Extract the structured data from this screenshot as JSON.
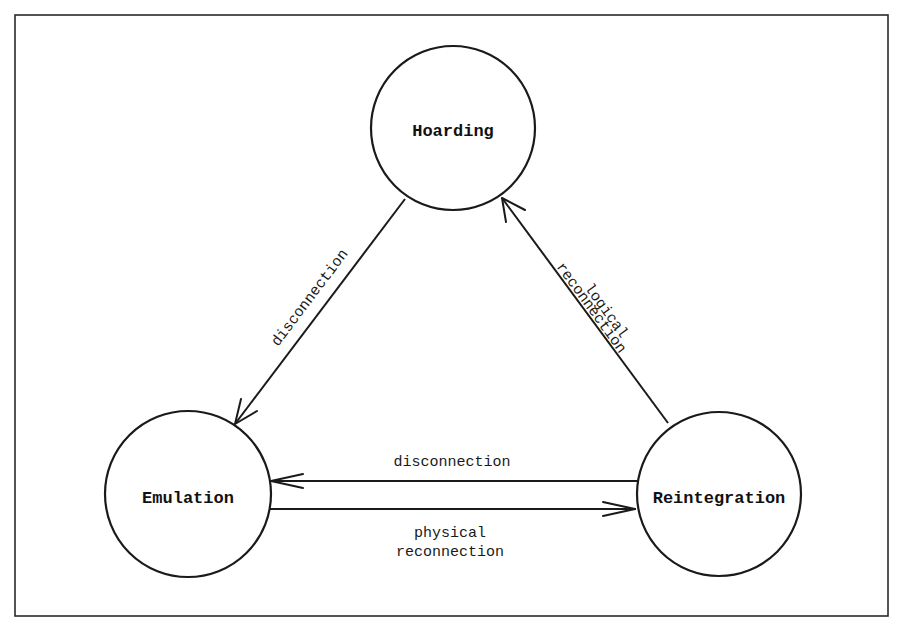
{
  "diagram": {
    "type": "state-transition",
    "states": [
      {
        "id": "hoarding",
        "label": "Hoarding"
      },
      {
        "id": "emulation",
        "label": "Emulation"
      },
      {
        "id": "reintegration",
        "label": "Reintegration"
      }
    ],
    "transitions": [
      {
        "from": "hoarding",
        "to": "emulation",
        "label_lines": [
          "disconnection"
        ]
      },
      {
        "from": "reintegration",
        "to": "hoarding",
        "label_lines": [
          "logical",
          "reconnection"
        ]
      },
      {
        "from": "reintegration",
        "to": "emulation",
        "label_lines": [
          "disconnection"
        ]
      },
      {
        "from": "emulation",
        "to": "reintegration",
        "label_lines": [
          "physical",
          "reconnection"
        ]
      }
    ]
  },
  "colors": {
    "background": "#ffffff",
    "stroke": "#1a1a1a",
    "text": "#111111"
  }
}
